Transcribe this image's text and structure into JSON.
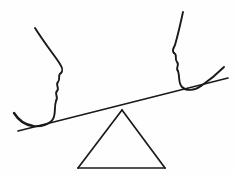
{
  "artwork": {
    "title": "Two face profiles on a balanced seesaw",
    "medium": "hand-drawn ink line drawing",
    "background_color": "#fefefe",
    "ink_color": "#1a1a1a",
    "canvas": {
      "width": 235,
      "height": 175
    }
  },
  "elements": {
    "left_profile": {
      "label": "Left face profile facing right",
      "forehead_label": "Left forehead and brow line",
      "nose_label": "Left nose",
      "lips_label": "Left lips",
      "chin_label": "Left chin",
      "jaw_label": "Left jaw sweep"
    },
    "right_profile": {
      "label": "Right face profile facing left",
      "forehead_label": "Right forehead and brow line",
      "nose_label": "Right nose",
      "lips_label": "Right lips",
      "chin_label": "Right chin",
      "jaw_label": "Right jaw sweep"
    },
    "plank": {
      "label": "Seesaw plank tilted down to the left",
      "left_end": "18, 131",
      "right_end": "228, 78"
    },
    "fulcrum": {
      "label": "Triangular fulcrum",
      "apex": "122, 110",
      "base_left": "78, 168",
      "base_right": "165, 168"
    }
  },
  "paths": {
    "left_forehead_nose": "M35,28 C45,44 55,56 60,64 C63,69 63,71 61,73",
    "left_lips": "M61,73 C57,75 61,79 58,82 C55,85 60,88 57,91 C54,94 59,97 56,101",
    "left_chin": "M56,101 C54,107 56,114 53,119 C50,124 42,127 33,126",
    "left_jaw": "M33,126 C26,125 19,121 14,113",
    "right_forehead_nose": "M183,12 C180,26 177,38 175,45 C173,49 172,51 174,53",
    "right_lips": "M174,53 C178,55 174,59 177,62 C180,65 175,68 178,71",
    "right_chin": "M178,71 C180,77 178,83 182,87 C186,91 194,91 201,86",
    "right_jaw": "M201,86 C210,80 218,73 224,67",
    "plank": "M18,131 L228,78",
    "fulcrum_left": "M122,110 L78,168",
    "fulcrum_right": "M122,110 L165,168",
    "fulcrum_base": "M78,168 L165,168"
  }
}
